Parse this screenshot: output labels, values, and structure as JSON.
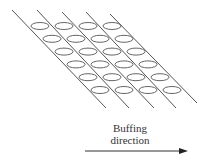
{
  "diagram": {
    "fibers": [
      {
        "x1": 12,
        "y1": 10,
        "x2": 106,
        "y2": 108
      },
      {
        "x1": 37,
        "y1": 10,
        "x2": 129,
        "y2": 108
      },
      {
        "x1": 62,
        "y1": 12,
        "x2": 154,
        "y2": 108
      },
      {
        "x1": 86,
        "y1": 12,
        "x2": 176,
        "y2": 108
      },
      {
        "x1": 110,
        "y1": 14,
        "x2": 197,
        "y2": 103
      }
    ],
    "ellipse_grid": {
      "rows": 6,
      "cols": 4,
      "origin_x": 40,
      "origin_y": 26,
      "col_step_x": 24,
      "row_step_x": 12,
      "row_step_y": 12.8,
      "rx": 9,
      "ry": 3.5
    },
    "label": {
      "line1": "Buffing",
      "line2": "direction"
    },
    "arrow": {
      "x1": 85,
      "y1": 151,
      "x2": 188,
      "y2": 151
    },
    "colors": {
      "line": "#555555",
      "text": "#333333",
      "arrow": "#222222"
    }
  }
}
